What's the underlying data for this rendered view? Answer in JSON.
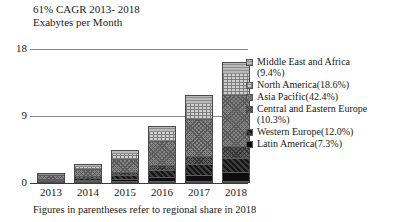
{
  "title": {
    "line1": "61% CAGR 2013- 2018",
    "line2": "Exabytes per Month"
  },
  "footnote": "Figures in parentheses refer to regional share in 2018",
  "axis": {
    "yticks": [
      "18",
      "9",
      "0"
    ],
    "xlabels": [
      "2013",
      "2014",
      "2015",
      "2016",
      "2017",
      "2018"
    ]
  },
  "legend": [
    {
      "label": "Middle East and Africa\n(9.4%)",
      "pattern": "p-mea"
    },
    {
      "label": "North America(18.6%)",
      "pattern": "p-na"
    },
    {
      "label": "Asia Pacific(42.4%)",
      "pattern": "p-ap"
    },
    {
      "label": "Central and Eastern Europe\n(10.3%)",
      "pattern": "p-cee"
    },
    {
      "label": "Western Europe(12.0%)",
      "pattern": "p-we"
    },
    {
      "label": "Latin America(7.3%)",
      "pattern": "p-la"
    }
  ],
  "chart_data": {
    "type": "bar",
    "subtype": "stacked-bar",
    "title": "61% CAGR 2013- 2018 Exabytes per Month",
    "xlabel": "",
    "ylabel": "Exabytes per Month",
    "ylim": [
      0,
      18
    ],
    "yticks": [
      0,
      9,
      18
    ],
    "grid": true,
    "legend_position": "right",
    "categories": [
      "2013",
      "2014",
      "2015",
      "2016",
      "2017",
      "2018"
    ],
    "series": [
      {
        "name": "Latin America(7.3%)",
        "share": 7.3,
        "values": [
          0.1,
          0.18,
          0.33,
          0.55,
          0.85,
          1.18
        ]
      },
      {
        "name": "Western Europe(12.0%)",
        "share": 12.0,
        "values": [
          0.16,
          0.3,
          0.54,
          0.92,
          1.42,
          1.95
        ]
      },
      {
        "name": "Central and Eastern Europe(10.3%)",
        "share": 10.3,
        "values": [
          0.14,
          0.26,
          0.46,
          0.78,
          1.22,
          1.67
        ]
      },
      {
        "name": "Asia Pacific(42.4%)",
        "share": 42.4,
        "values": [
          0.57,
          1.06,
          1.9,
          3.22,
          5.02,
          6.87
        ]
      },
      {
        "name": "North America(18.6%)",
        "share": 18.6,
        "values": [
          0.25,
          0.46,
          0.83,
          1.41,
          2.2,
          3.01
        ]
      },
      {
        "name": "Middle East and Africa(9.4%)",
        "share": 9.4,
        "values": [
          0.13,
          0.24,
          0.42,
          0.71,
          1.11,
          1.52
        ]
      }
    ],
    "totals": [
      1.35,
      2.5,
      4.48,
      7.59,
      11.82,
      16.2
    ]
  }
}
